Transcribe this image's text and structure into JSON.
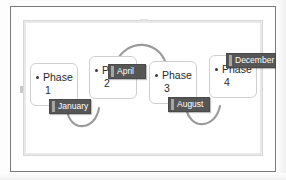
{
  "document": {
    "type": "scanned-slide",
    "background_color": "#ffffff",
    "frame_border_color": "#7b7b7b",
    "inner_frame_color": "#e9e9e9"
  },
  "diagram": {
    "kind": "phase-timeline",
    "accent_color": "#565656",
    "arc_color": "#9a9a9a",
    "box_border_color": "#cfcfcf",
    "phases": [
      {
        "id": "phase-1",
        "label": "Phase",
        "number": "1"
      },
      {
        "id": "phase-2",
        "label": "Phase",
        "number": "2"
      },
      {
        "id": "phase-3",
        "label": "Phase",
        "number": "3"
      },
      {
        "id": "phase-4",
        "label": "Phase",
        "number": "4"
      }
    ],
    "milestones": [
      {
        "id": "milestone-january",
        "label": "January"
      },
      {
        "id": "milestone-april",
        "label": "April"
      },
      {
        "id": "milestone-august",
        "label": "August"
      },
      {
        "id": "milestone-december",
        "label": "December"
      }
    ],
    "connectors": [
      {
        "id": "arc-1-2",
        "from": "phase-1",
        "to": "phase-2",
        "position": "below"
      },
      {
        "id": "arc-2-3",
        "from": "phase-2",
        "to": "phase-3",
        "position": "above"
      },
      {
        "id": "arc-3-4",
        "from": "phase-3",
        "to": "phase-4",
        "position": "below"
      }
    ]
  }
}
